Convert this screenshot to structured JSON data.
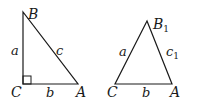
{
  "diagram": {
    "left_triangle": {
      "vertices": {
        "B": "B",
        "C": "C",
        "A": "A"
      },
      "sides": {
        "a": "a",
        "b": "b",
        "c": "c"
      },
      "right_angle_at": "C"
    },
    "right_triangle": {
      "vertices": {
        "B": "B",
        "B_sub": "1",
        "C": "C",
        "A": "A"
      },
      "sides": {
        "a": "a",
        "b": "b",
        "c": "c",
        "c_sub": "1"
      }
    },
    "colors": {
      "stroke": "#1a1a1a",
      "background": "#ffffff"
    }
  }
}
